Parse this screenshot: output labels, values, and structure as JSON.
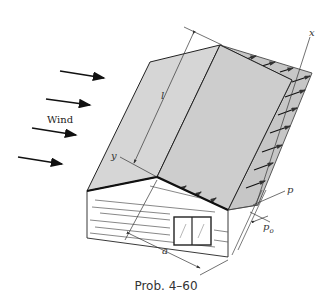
{
  "figure": {
    "caption": "Prob. 4–60",
    "wind_label": "Wind",
    "labels": {
      "x_axis": "x",
      "y_axis": "y",
      "length": "l",
      "width": "a",
      "pressure": "p",
      "pressure_base": "p",
      "pressure_base_sub": "o"
    },
    "wind_arrow_count": 4,
    "colors": {
      "roof_fill": "#d4d4d4",
      "roof_side_fill": "#cfcfcf",
      "pressure_fill": "#c6c6c6",
      "line": "#222222"
    }
  }
}
